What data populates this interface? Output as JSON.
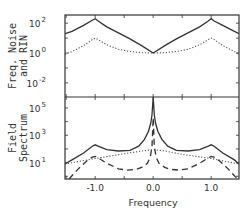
{
  "chart_data": [
    {
      "type": "line",
      "panel": "top",
      "ylabel_lines": [
        "Freq. Noise",
        "and RIN"
      ],
      "yscale": "log",
      "ylim_log10": [
        -2.95,
        2.55
      ],
      "xlim": [
        -1.52,
        1.48
      ],
      "yticks": [
        {
          "base": "10",
          "exp": "2",
          "log10": 2
        },
        {
          "base": "10",
          "exp": "0",
          "log10": 0
        },
        {
          "base": "10",
          "exp": "-2",
          "log10": -2
        }
      ],
      "series": [
        {
          "name": "frequency noise",
          "style": "solid",
          "x": [
            -1.52,
            -1.4,
            -1.2,
            -1.05,
            -1.0,
            -0.95,
            -0.8,
            -0.6,
            -0.4,
            -0.2,
            0.0,
            0.2,
            0.4,
            0.6,
            0.8,
            0.95,
            1.0,
            1.05,
            1.2,
            1.4,
            1.48
          ],
          "log10_y": [
            1.3,
            1.45,
            1.85,
            2.2,
            2.3,
            2.15,
            1.75,
            1.35,
            0.95,
            0.5,
            0.0,
            0.5,
            0.95,
            1.35,
            1.75,
            2.15,
            2.3,
            2.15,
            1.85,
            1.45,
            1.3
          ]
        },
        {
          "name": "RIN",
          "style": "dotted",
          "x": [
            -1.52,
            -1.4,
            -1.2,
            -1.05,
            -1.0,
            -0.95,
            -0.8,
            -0.6,
            -0.4,
            -0.2,
            0.0,
            0.2,
            0.4,
            0.6,
            0.8,
            0.95,
            1.0,
            1.05,
            1.2,
            1.4,
            1.48
          ],
          "log10_y": [
            -0.1,
            0.1,
            0.5,
            0.9,
            1.0,
            0.9,
            0.55,
            0.25,
            0.1,
            0.02,
            0.0,
            0.02,
            0.1,
            0.25,
            0.55,
            0.9,
            1.0,
            0.9,
            0.5,
            0.1,
            -0.1
          ]
        }
      ]
    },
    {
      "type": "line",
      "panel": "bottom",
      "ylabel_lines": [
        "Field",
        "Spectrum"
      ],
      "yscale": "log",
      "ylim_log10": [
        -0.2,
        5.8
      ],
      "xlim": [
        -1.52,
        1.48
      ],
      "xlabel": "Frequency",
      "xticks": [
        -1.0,
        0.0,
        1.0
      ],
      "xtick_labels": [
        "-1.0",
        "0.0",
        "1.0"
      ],
      "yticks": [
        {
          "base": "10",
          "exp": "5",
          "log10": 5
        },
        {
          "base": "10",
          "exp": "3",
          "log10": 3
        },
        {
          "base": "10",
          "exp": "1",
          "log10": 1
        }
      ],
      "series": [
        {
          "name": "total field spectrum",
          "style": "solid",
          "x": [
            -1.52,
            -1.4,
            -1.2,
            -1.05,
            -1.0,
            -0.95,
            -0.8,
            -0.6,
            -0.4,
            -0.25,
            -0.15,
            -0.08,
            -0.04,
            -0.02,
            0.0,
            0.02,
            0.04,
            0.08,
            0.15,
            0.25,
            0.4,
            0.6,
            0.8,
            0.95,
            1.0,
            1.05,
            1.2,
            1.4,
            1.48
          ],
          "log10_y": [
            0.9,
            1.2,
            1.7,
            2.2,
            2.3,
            2.2,
            1.95,
            1.85,
            1.9,
            2.2,
            2.7,
            3.3,
            3.9,
            4.5,
            5.8,
            4.5,
            3.9,
            3.3,
            2.7,
            2.2,
            1.9,
            1.85,
            1.95,
            2.2,
            2.3,
            2.2,
            1.7,
            1.2,
            0.9
          ]
        },
        {
          "name": "background",
          "style": "dotted",
          "x": [
            -1.52,
            -1.0,
            -0.5,
            -0.2,
            0.0,
            0.2,
            0.5,
            1.0,
            1.48
          ],
          "log10_y": [
            0.9,
            1.3,
            1.65,
            1.85,
            1.95,
            1.85,
            1.6,
            1.3,
            0.9
          ]
        },
        {
          "name": "sideband / carrier components",
          "style": "dashed",
          "x": [
            -1.45,
            -1.3,
            -1.15,
            -1.05,
            -1.0,
            -0.95,
            -0.8,
            -0.6,
            -0.45,
            -0.3,
            -0.2,
            -0.1,
            -0.05,
            -0.02,
            0.0,
            0.02,
            0.05,
            0.1,
            0.2,
            0.3,
            0.45,
            0.6,
            0.8,
            0.95,
            1.0,
            1.05,
            1.15,
            1.3,
            1.45
          ],
          "log10_y": [
            -0.2,
            0.5,
            1.1,
            1.4,
            1.45,
            1.35,
            0.95,
            0.55,
            0.45,
            0.5,
            0.65,
            0.95,
            1.4,
            2.2,
            4.3,
            2.2,
            1.4,
            0.95,
            0.65,
            0.5,
            0.45,
            0.55,
            0.95,
            1.35,
            1.45,
            1.4,
            1.1,
            0.5,
            -0.2
          ]
        }
      ]
    }
  ],
  "layout": {
    "plot_left": 65,
    "plot_right": 239,
    "top_panel": {
      "top": 15,
      "bottom": 97
    },
    "bottom_panel": {
      "top": 97,
      "bottom": 179
    }
  }
}
